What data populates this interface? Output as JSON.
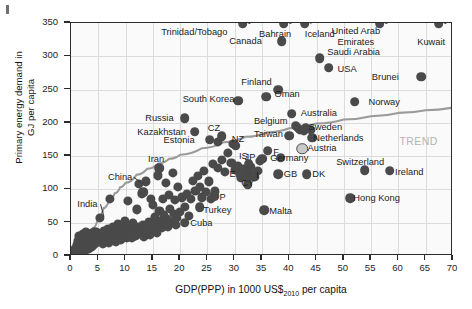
{
  "chart_data": {
    "type": "scatter",
    "title": "",
    "xlabel": "GDP(PPP) in 1000 US$2010 per capita",
    "xlabel_main": "GDP(PPP) in 1000 US$",
    "xlabel_sub": "2010",
    "xlabel_tail": " per capita",
    "ylabel": "Primary energy demand in GJ per capita",
    "ylabel_line1": "Primary energy demand in",
    "ylabel_line2": "GJ per capita",
    "xlim": [
      0,
      70
    ],
    "ylim": [
      0,
      350
    ],
    "xticks": [
      0,
      5,
      10,
      15,
      20,
      25,
      30,
      35,
      40,
      45,
      50,
      55,
      60,
      65,
      70
    ],
    "yticks": [
      0,
      50,
      100,
      150,
      200,
      250,
      300,
      350
    ],
    "grid": true,
    "legend": null,
    "annotations": [
      {
        "text": "TREND",
        "x": 63.5,
        "y": 173,
        "color": "#b4b4b4"
      }
    ],
    "trend_note": "TREND",
    "trend_curve_color": "#9a9a9a",
    "point_color": "#4a4a4a",
    "labeled_points": [
      {
        "label": "Trinidad/Tobago",
        "x": 31.5,
        "y": 352,
        "clipped": true,
        "lx": 22.6,
        "ly": 336,
        "align": "center"
      },
      {
        "label": "Bahrain",
        "x": 39.0,
        "y": 352,
        "clipped": true,
        "lx": 37.4,
        "ly": 333,
        "align": "center"
      },
      {
        "label": "Canada",
        "x": 38.6,
        "y": 323,
        "lx": 32.0,
        "ly": 323,
        "align": "center"
      },
      {
        "label": "Iceland",
        "x": 42.8,
        "y": 352,
        "clipped": true,
        "lx": 45.6,
        "ly": 333,
        "align": "center"
      },
      {
        "label": "United Arab Emirates",
        "x": 56.6,
        "y": 352,
        "clipped": true,
        "lx": 52.2,
        "ly": 330,
        "align": "center",
        "twoline": true
      },
      {
        "label": "Kuwait",
        "x": 67.4,
        "y": 352,
        "clipped": true,
        "lx": 66.0,
        "ly": 321,
        "align": "center"
      },
      {
        "label": "Saudi Arabia",
        "x": 45.6,
        "y": 297,
        "lx": 51.8,
        "ly": 307,
        "align": "center"
      },
      {
        "label": "USA",
        "x": 47.2,
        "y": 283,
        "lx": 50.6,
        "ly": 281,
        "align": "left"
      },
      {
        "label": "Brunei",
        "x": 64.2,
        "y": 269,
        "lx": 57.6,
        "ly": 269,
        "align": "center"
      },
      {
        "label": "Finland",
        "x": 38.0,
        "y": 250,
        "lx": 34.0,
        "ly": 262,
        "align": "center"
      },
      {
        "label": "Oman",
        "x": 35.8,
        "y": 239,
        "lx": 39.6,
        "ly": 243,
        "align": "left"
      },
      {
        "label": "Norway",
        "x": 52.0,
        "y": 232,
        "lx": 57.4,
        "ly": 231,
        "align": "left"
      },
      {
        "label": "South Korea",
        "x": 30.6,
        "y": 233,
        "lx": 25.2,
        "ly": 236,
        "align": "center"
      },
      {
        "label": "Australia",
        "x": 40.4,
        "y": 214,
        "lx": 45.4,
        "ly": 215,
        "align": "left"
      },
      {
        "label": "Russia",
        "x": 20.8,
        "y": 207,
        "lx": 16.2,
        "ly": 208,
        "align": "center"
      },
      {
        "label": "Belgium",
        "x": 41.2,
        "y": 196,
        "lx": 36.6,
        "ly": 203,
        "align": "center"
      },
      {
        "label": "Sweden",
        "x": 43.0,
        "y": 193,
        "lx": 46.6,
        "ly": 194,
        "align": "left"
      },
      {
        "label": "Kazakhstan",
        "x": 22.7,
        "y": 187,
        "lx": 16.6,
        "ly": 187,
        "align": "center"
      },
      {
        "label": "CZ",
        "x": 27.6,
        "y": 180,
        "lx": 26.2,
        "ly": 192,
        "align": "center"
      },
      {
        "label": "Taiwan",
        "x": 40.0,
        "y": 181,
        "lx": 36.2,
        "ly": 183,
        "align": "center"
      },
      {
        "label": "Estonia",
        "x": 25.4,
        "y": 175,
        "lx": 19.8,
        "ly": 175,
        "align": "center"
      },
      {
        "label": "Netherlands",
        "x": 44.2,
        "y": 178,
        "lx": 49.0,
        "ly": 177,
        "align": "left"
      },
      {
        "label": "NZ",
        "x": 30.2,
        "y": 166,
        "lx": 30.6,
        "ly": 176,
        "align": "center"
      },
      {
        "label": "Austria",
        "x": 42.4,
        "y": 161,
        "lx": 46.0,
        "ly": 162,
        "align": "left",
        "hollow": true
      },
      {
        "label": "F",
        "x": 36.0,
        "y": 158,
        "lx": 37.6,
        "ly": 157,
        "align": "left"
      },
      {
        "label": "Germany",
        "x": 38.4,
        "y": 148,
        "lx": 40.0,
        "ly": 147,
        "align": "center"
      },
      {
        "label": "JP",
        "x": 35.0,
        "y": 146,
        "lx": 32.8,
        "ly": 149,
        "align": "center"
      },
      {
        "label": "IS",
        "x": 32.6,
        "y": 139,
        "lx": 31.6,
        "ly": 150,
        "align": "center"
      },
      {
        "label": "Iran",
        "x": 16.2,
        "y": 132,
        "lx": 15.6,
        "ly": 146,
        "align": "center"
      },
      {
        "label": "Switzerland",
        "x": 53.8,
        "y": 129,
        "lx": 53.0,
        "ly": 142,
        "align": "center"
      },
      {
        "label": "Ireland",
        "x": 58.4,
        "y": 128,
        "lx": 62.0,
        "ly": 127,
        "align": "left"
      },
      {
        "label": "GB",
        "x": 38.0,
        "y": 123,
        "lx": 40.2,
        "ly": 123,
        "align": "left"
      },
      {
        "label": "DK",
        "x": 43.2,
        "y": 123,
        "lx": 45.4,
        "ly": 123,
        "align": "left"
      },
      {
        "label": "E",
        "x": 31.0,
        "y": 124,
        "lx": 29.6,
        "ly": 124,
        "align": "center"
      },
      {
        "label": "I",
        "x": 33.2,
        "y": 121,
        "lx": 34.2,
        "ly": 121,
        "align": "left"
      },
      {
        "label": "CY",
        "x": 32.4,
        "y": 108,
        "lx": 32.4,
        "ly": 110,
        "align": "center"
      },
      {
        "label": "P",
        "x": 26.2,
        "y": 90,
        "lx": 27.8,
        "ly": 89,
        "align": "left"
      },
      {
        "label": "Hong Kong",
        "x": 51.2,
        "y": 87,
        "lx": 56.0,
        "ly": 87,
        "align": "left"
      },
      {
        "label": "Turkey",
        "x": 23.6,
        "y": 73,
        "lx": 26.8,
        "ly": 69,
        "align": "left"
      },
      {
        "label": "Malta",
        "x": 35.4,
        "y": 69,
        "lx": 38.4,
        "ly": 68,
        "align": "left"
      },
      {
        "label": "China",
        "x": 13.2,
        "y": 96,
        "lx": 9.0,
        "ly": 119,
        "align": "center",
        "leader": true
      },
      {
        "label": "Cuba",
        "x": 20.8,
        "y": 50,
        "lx": 23.9,
        "ly": 50,
        "align": "left"
      },
      {
        "label": "India",
        "x": 4.4,
        "y": 36,
        "lx": 3.0,
        "ly": 78,
        "align": "center",
        "leader": true
      }
    ],
    "unlabeled_points_note": "dense cloud of ~150 unlabeled country points",
    "unlabeled_points": [
      [
        0.6,
        6
      ],
      [
        0.8,
        11
      ],
      [
        1.0,
        4
      ],
      [
        1.1,
        16
      ],
      [
        1.3,
        22
      ],
      [
        1.4,
        9
      ],
      [
        1.5,
        30
      ],
      [
        1.6,
        14
      ],
      [
        1.8,
        25
      ],
      [
        1.9,
        7
      ],
      [
        2.0,
        18
      ],
      [
        2.1,
        33
      ],
      [
        2.2,
        12
      ],
      [
        2.4,
        27
      ],
      [
        2.5,
        8
      ],
      [
        2.6,
        21
      ],
      [
        2.8,
        36
      ],
      [
        2.9,
        15
      ],
      [
        3.0,
        24
      ],
      [
        3.2,
        10
      ],
      [
        3.3,
        31
      ],
      [
        3.5,
        19
      ],
      [
        3.6,
        28
      ],
      [
        3.8,
        13
      ],
      [
        3.9,
        35
      ],
      [
        4.1,
        23
      ],
      [
        4.2,
        17
      ],
      [
        4.4,
        29
      ],
      [
        4.6,
        20
      ],
      [
        4.8,
        26
      ],
      [
        5.0,
        34
      ],
      [
        5.1,
        22
      ],
      [
        5.3,
        57
      ],
      [
        5.5,
        30
      ],
      [
        5.7,
        25
      ],
      [
        5.9,
        18
      ],
      [
        6.0,
        38
      ],
      [
        6.2,
        28
      ],
      [
        6.4,
        33
      ],
      [
        6.6,
        24
      ],
      [
        6.8,
        41
      ],
      [
        6.9,
        20
      ],
      [
        7.1,
        86
      ],
      [
        7.2,
        35
      ],
      [
        7.4,
        29
      ],
      [
        7.6,
        44
      ],
      [
        7.8,
        26
      ],
      [
        8.0,
        33
      ],
      [
        8.2,
        22
      ],
      [
        8.4,
        39
      ],
      [
        8.6,
        48
      ],
      [
        8.8,
        30
      ],
      [
        9.0,
        36
      ],
      [
        9.2,
        25
      ],
      [
        9.4,
        43
      ],
      [
        9.6,
        31
      ],
      [
        9.8,
        52
      ],
      [
        10.0,
        38
      ],
      [
        10.2,
        28
      ],
      [
        10.4,
        83
      ],
      [
        10.6,
        45
      ],
      [
        10.8,
        34
      ],
      [
        11.0,
        40
      ],
      [
        11.2,
        27
      ],
      [
        11.4,
        49
      ],
      [
        11.6,
        36
      ],
      [
        11.8,
        31
      ],
      [
        12.0,
        70
      ],
      [
        12.2,
        44
      ],
      [
        12.4,
        108
      ],
      [
        12.6,
        38
      ],
      [
        12.8,
        33
      ],
      [
        13.0,
        94
      ],
      [
        13.2,
        46
      ],
      [
        13.4,
        29
      ],
      [
        13.6,
        41
      ],
      [
        13.8,
        112
      ],
      [
        14.0,
        36
      ],
      [
        14.2,
        51
      ],
      [
        14.4,
        32
      ],
      [
        14.6,
        86
      ],
      [
        14.8,
        44
      ],
      [
        15.0,
        77
      ],
      [
        15.2,
        39
      ],
      [
        15.4,
        58
      ],
      [
        15.6,
        47
      ],
      [
        15.8,
        35
      ],
      [
        16.0,
        121
      ],
      [
        16.2,
        68
      ],
      [
        16.4,
        53
      ],
      [
        16.6,
        42
      ],
      [
        16.8,
        86
      ],
      [
        17.0,
        62
      ],
      [
        17.2,
        48
      ],
      [
        17.4,
        110
      ],
      [
        17.6,
        56
      ],
      [
        17.8,
        44
      ],
      [
        18.0,
        92
      ],
      [
        18.2,
        71
      ],
      [
        18.4,
        51
      ],
      [
        18.6,
        125
      ],
      [
        18.8,
        63
      ],
      [
        19.0,
        84
      ],
      [
        19.2,
        47
      ],
      [
        19.4,
        57
      ],
      [
        19.6,
        104
      ],
      [
        20.0,
        66
      ],
      [
        20.4,
        88
      ],
      [
        20.8,
        74
      ],
      [
        21.2,
        93
      ],
      [
        21.6,
        60
      ],
      [
        22.0,
        86
      ],
      [
        22.4,
        113
      ],
      [
        22.8,
        98
      ],
      [
        23.2,
        120
      ],
      [
        23.6,
        104
      ],
      [
        24.0,
        88
      ],
      [
        24.4,
        128
      ],
      [
        24.8,
        96
      ],
      [
        25.2,
        112
      ],
      [
        25.6,
        86
      ],
      [
        26.0,
        138
      ],
      [
        26.4,
        97
      ],
      [
        27.0,
        132
      ],
      [
        27.6,
        145
      ],
      [
        28.2,
        126
      ],
      [
        28.8,
        155
      ],
      [
        29.4,
        140
      ],
      [
        30.0,
        129
      ],
      [
        30.6,
        136
      ],
      [
        31.2,
        118
      ],
      [
        31.6,
        131
      ],
      [
        32.0,
        126
      ],
      [
        32.4,
        117
      ],
      [
        32.8,
        122
      ],
      [
        33.0,
        134
      ],
      [
        33.6,
        119
      ],
      [
        34.2,
        128
      ],
      [
        34.6,
        143
      ],
      [
        41.6,
        192
      ],
      [
        42.0,
        189
      ],
      [
        42.6,
        188
      ],
      [
        44.0,
        190
      ],
      [
        29.6,
        168
      ],
      [
        27.0,
        172
      ]
    ],
    "trend_curve_points": [
      [
        2.0,
        0
      ],
      [
        3.0,
        22
      ],
      [
        4.0,
        42
      ],
      [
        5.0,
        58
      ],
      [
        6.0,
        72
      ],
      [
        7.0,
        84
      ],
      [
        8.0,
        94
      ],
      [
        9.0,
        103
      ],
      [
        10.0,
        110
      ],
      [
        12.0,
        122
      ],
      [
        14.0,
        131
      ],
      [
        16.0,
        139
      ],
      [
        18.0,
        146
      ],
      [
        20.0,
        152
      ],
      [
        24.0,
        162
      ],
      [
        28.0,
        171
      ],
      [
        32.0,
        179
      ],
      [
        36.0,
        186
      ],
      [
        40.0,
        192
      ],
      [
        45.0,
        199
      ],
      [
        50.0,
        205
      ],
      [
        55.0,
        210
      ],
      [
        60.0,
        215
      ],
      [
        65.0,
        219
      ],
      [
        70.0,
        223
      ]
    ]
  }
}
